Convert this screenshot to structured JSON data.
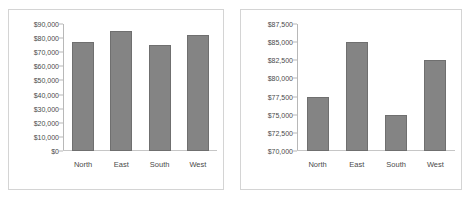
{
  "chart_data": [
    {
      "type": "bar",
      "name": "full-scale-chart",
      "title": "",
      "xlabel": "",
      "ylabel": "",
      "categories": [
        "North",
        "East",
        "South",
        "West"
      ],
      "values": [
        77500,
        85000,
        75000,
        82500
      ],
      "ylim": [
        0,
        90000
      ],
      "yticks": [
        0,
        10000,
        20000,
        30000,
        40000,
        50000,
        60000,
        70000,
        80000,
        90000
      ],
      "ytick_labels": [
        "$0",
        "$10,000",
        "$20,000",
        "$30,000",
        "$40,000",
        "$50,000",
        "$60,000",
        "$70,000",
        "$80,000",
        "$90,000"
      ],
      "grid": false,
      "legend": "none",
      "bar_color": "#848484",
      "bar_edge_color": "#6f6f6f"
    },
    {
      "type": "bar",
      "name": "truncated-scale-chart",
      "title": "",
      "xlabel": "",
      "ylabel": "",
      "categories": [
        "North",
        "East",
        "South",
        "West"
      ],
      "values": [
        77500,
        85000,
        75000,
        82500
      ],
      "ylim": [
        70000,
        87500
      ],
      "yticks": [
        70000,
        72500,
        75000,
        77500,
        80000,
        82500,
        85000,
        87500
      ],
      "ytick_labels": [
        "$70,000",
        "$72,500",
        "$75,000",
        "$77,500",
        "$80,000",
        "$82,500",
        "$85,000",
        "$87,500"
      ],
      "grid": false,
      "legend": "none",
      "bar_color": "#848484",
      "bar_edge_color": "#6f6f6f"
    }
  ],
  "colors": {
    "background": "#ffffff",
    "panel_border": "#d4d4d4",
    "axis": "#b8b8b8",
    "baseline": "#c6c6c6",
    "text": "#4a4a4a",
    "bar_fill": "#848484",
    "bar_edge": "#6f6f6f"
  }
}
